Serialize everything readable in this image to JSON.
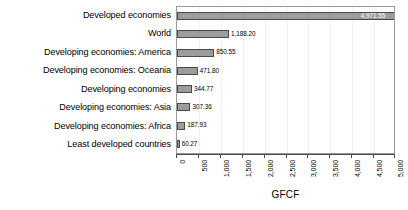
{
  "chart_data": {
    "type": "bar",
    "orientation": "horizontal",
    "title": "",
    "xlabel": "GFCF",
    "ylabel": "",
    "xlim": [
      0,
      5000
    ],
    "grid": true,
    "legend": "none",
    "categories": [
      "Developed economies",
      "World",
      "Developing economies: America",
      "Developing economies: Oceania",
      "Developing economies",
      "Developing economies: Asia",
      "Developing economies: Africa",
      "Least developed countries"
    ],
    "values": [
      4971.55,
      1188.2,
      850.55,
      471.8,
      344.77,
      307.36,
      187.93,
      60.27
    ],
    "value_labels": [
      "4,971.55",
      "1,188.20",
      "850.55",
      "471.80",
      "344.77",
      "307.36",
      "187.93",
      "60.27"
    ],
    "xticks": [
      0,
      500,
      1000,
      1500,
      2000,
      2500,
      3000,
      3500,
      4000,
      4500,
      5000
    ],
    "xtick_labels": [
      "0",
      "500",
      "1,000",
      "1,500",
      "2,000",
      "2,500",
      "3,000",
      "3,500",
      "4,000",
      "4,500",
      "5,000"
    ],
    "colors": {
      "bar_fill": "#9c9c9c",
      "bar_border": "#4a4a4a",
      "panel_border": "#9a9a9a",
      "gridline": "#f0f0f0",
      "text": "#000000",
      "inside_label_text": "#ffffff"
    }
  }
}
